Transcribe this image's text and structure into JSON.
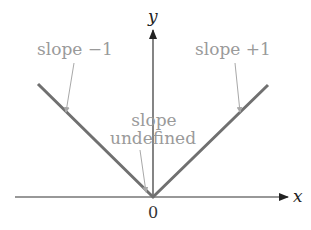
{
  "diagram": {
    "type": "absolute-value-graph",
    "axes": {
      "x_label": "x",
      "y_label": "y",
      "origin_label": "0"
    },
    "annotations": [
      {
        "id": "left",
        "line1": "slope −1"
      },
      {
        "id": "right",
        "line1": "slope +1"
      },
      {
        "id": "vertex",
        "line1": "slope",
        "line2": "undefined"
      }
    ],
    "colors": {
      "graph_line": "#707070",
      "axis": "#333333",
      "annotation_text": "#9a9a9a",
      "callout_arrow": "#a8a8a8"
    }
  }
}
